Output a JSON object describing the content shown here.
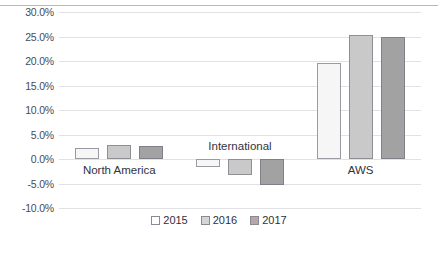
{
  "chart_data": {
    "type": "bar",
    "title": "",
    "subtitle": "",
    "xlabel": "",
    "ylabel": "",
    "categories": [
      "North America",
      "International",
      "AWS"
    ],
    "series": [
      {
        "name": "2015",
        "color": "#f6f6f6",
        "values": [
          2.3,
          -1.7,
          19.5
        ]
      },
      {
        "name": "2016",
        "color": "#c9c9c9",
        "values": [
          2.8,
          -3.3,
          25.4
        ]
      },
      {
        "name": "2017",
        "color": "#a2a2a2",
        "values": [
          2.7,
          -5.4,
          25.0
        ]
      }
    ],
    "ylim": [
      -10.0,
      30.0
    ],
    "ytick_step": 5.0,
    "ytick_labels": [
      "30.0%",
      "25.0%",
      "20.0%",
      "15.0%",
      "10.0%",
      "5.0%",
      "0.0%",
      "-5.0%",
      "-10.0%"
    ],
    "ytick_values": [
      30.0,
      25.0,
      20.0,
      15.0,
      10.0,
      5.0,
      0.0,
      -5.0,
      -10.0
    ],
    "grid": true,
    "grid_axis": "y",
    "legend": {
      "position": "bottom",
      "entries": [
        "2015",
        "2016",
        "2017"
      ]
    },
    "value_format": "percent"
  }
}
